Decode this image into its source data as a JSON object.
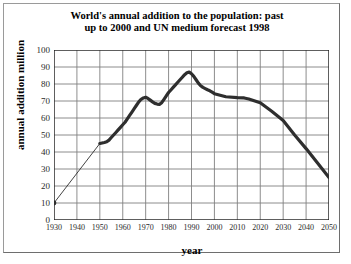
{
  "chart_data": {
    "type": "line",
    "title": "World's annual addition to the population: past up to 2000 and UN medium forecast 1998",
    "title_line1": "World's annual addition to the population: past",
    "title_line2": "up to 2000 and UN medium forecast 1998",
    "xlabel": "year",
    "ylabel": "annual addition million",
    "xlim": [
      1930,
      2050
    ],
    "ylim": [
      0,
      100
    ],
    "xticks": [
      1930,
      1940,
      1950,
      1960,
      1970,
      1980,
      1990,
      2000,
      2010,
      2020,
      2030,
      2040,
      2050
    ],
    "yticks": [
      0,
      10,
      20,
      30,
      40,
      50,
      60,
      70,
      80,
      90,
      100
    ],
    "grid": true,
    "legend": "none",
    "line_color": "#2e2e2e",
    "grid_color": "#808080",
    "axis_color": "#1a1a1a",
    "background": "#ffffff",
    "series": [
      {
        "name": "annual addition to world population",
        "x": [
          1930,
          1950,
          1951,
          1952,
          1953,
          1954,
          1955,
          1956,
          1957,
          1958,
          1959,
          1960,
          1961,
          1962,
          1963,
          1964,
          1965,
          1966,
          1967,
          1968,
          1969,
          1970,
          1971,
          1972,
          1973,
          1974,
          1975,
          1976,
          1977,
          1978,
          1979,
          1980,
          1981,
          1982,
          1983,
          1984,
          1985,
          1986,
          1987,
          1988,
          1989,
          1990,
          1991,
          1992,
          1993,
          1994,
          1995,
          1996,
          1997,
          1998,
          1999,
          2000,
          2005,
          2010,
          2013,
          2015,
          2020,
          2025,
          2030,
          2035,
          2040,
          2045,
          2050
        ],
        "y": [
          10,
          45,
          45.3,
          45.6,
          46,
          47,
          48.5,
          50,
          51.5,
          53,
          54.5,
          56,
          57.5,
          59.5,
          61.5,
          63.5,
          65.5,
          67.5,
          69.5,
          71,
          71.8,
          72.2,
          71.5,
          70.5,
          69.5,
          68.6,
          68.2,
          68,
          69,
          71,
          73,
          75,
          76.5,
          78,
          79.5,
          81,
          82.5,
          84,
          85.5,
          86.6,
          87,
          86,
          84.5,
          82.5,
          80.5,
          79,
          78,
          77.3,
          76.6,
          76,
          75.2,
          74.3,
          72.5,
          72,
          71.8,
          71.2,
          69,
          64,
          58.5,
          50,
          42,
          33.5,
          25
        ]
      }
    ],
    "annotations": [
      {
        "label": "start point 1930",
        "x": 1930,
        "y": 10,
        "marker": "dot"
      },
      {
        "label": "data begins (thick line) 1950",
        "x": 1950,
        "y": 45
      },
      {
        "label": "local peak ~1970",
        "x": 1970,
        "y": 72
      },
      {
        "label": "dip ~1976",
        "x": 1976,
        "y": 68
      },
      {
        "label": "global peak ~1989",
        "x": 1989,
        "y": 87
      },
      {
        "label": "plateau ~2005-2015",
        "x": 2010,
        "y": 72
      },
      {
        "label": "forecast end 2050",
        "x": 2050,
        "y": 25
      }
    ]
  }
}
